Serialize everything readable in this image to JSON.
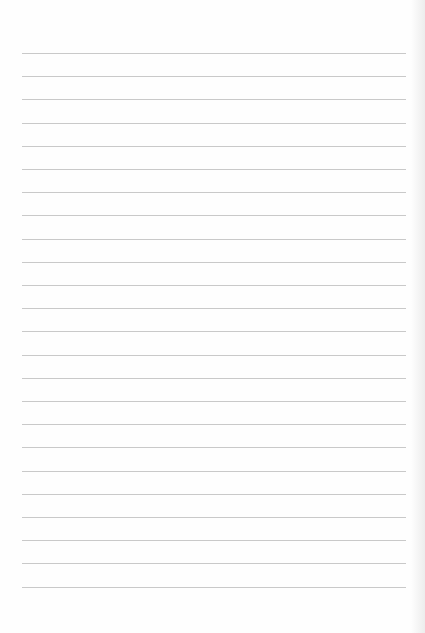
{
  "page": {
    "type": "lined-paper",
    "background_color": "#fefefe",
    "line_color": "#c9c9c9",
    "line_count": 24,
    "first_line_y": 53,
    "line_spacing": 23.2,
    "line_left": 22,
    "line_width": 384
  }
}
